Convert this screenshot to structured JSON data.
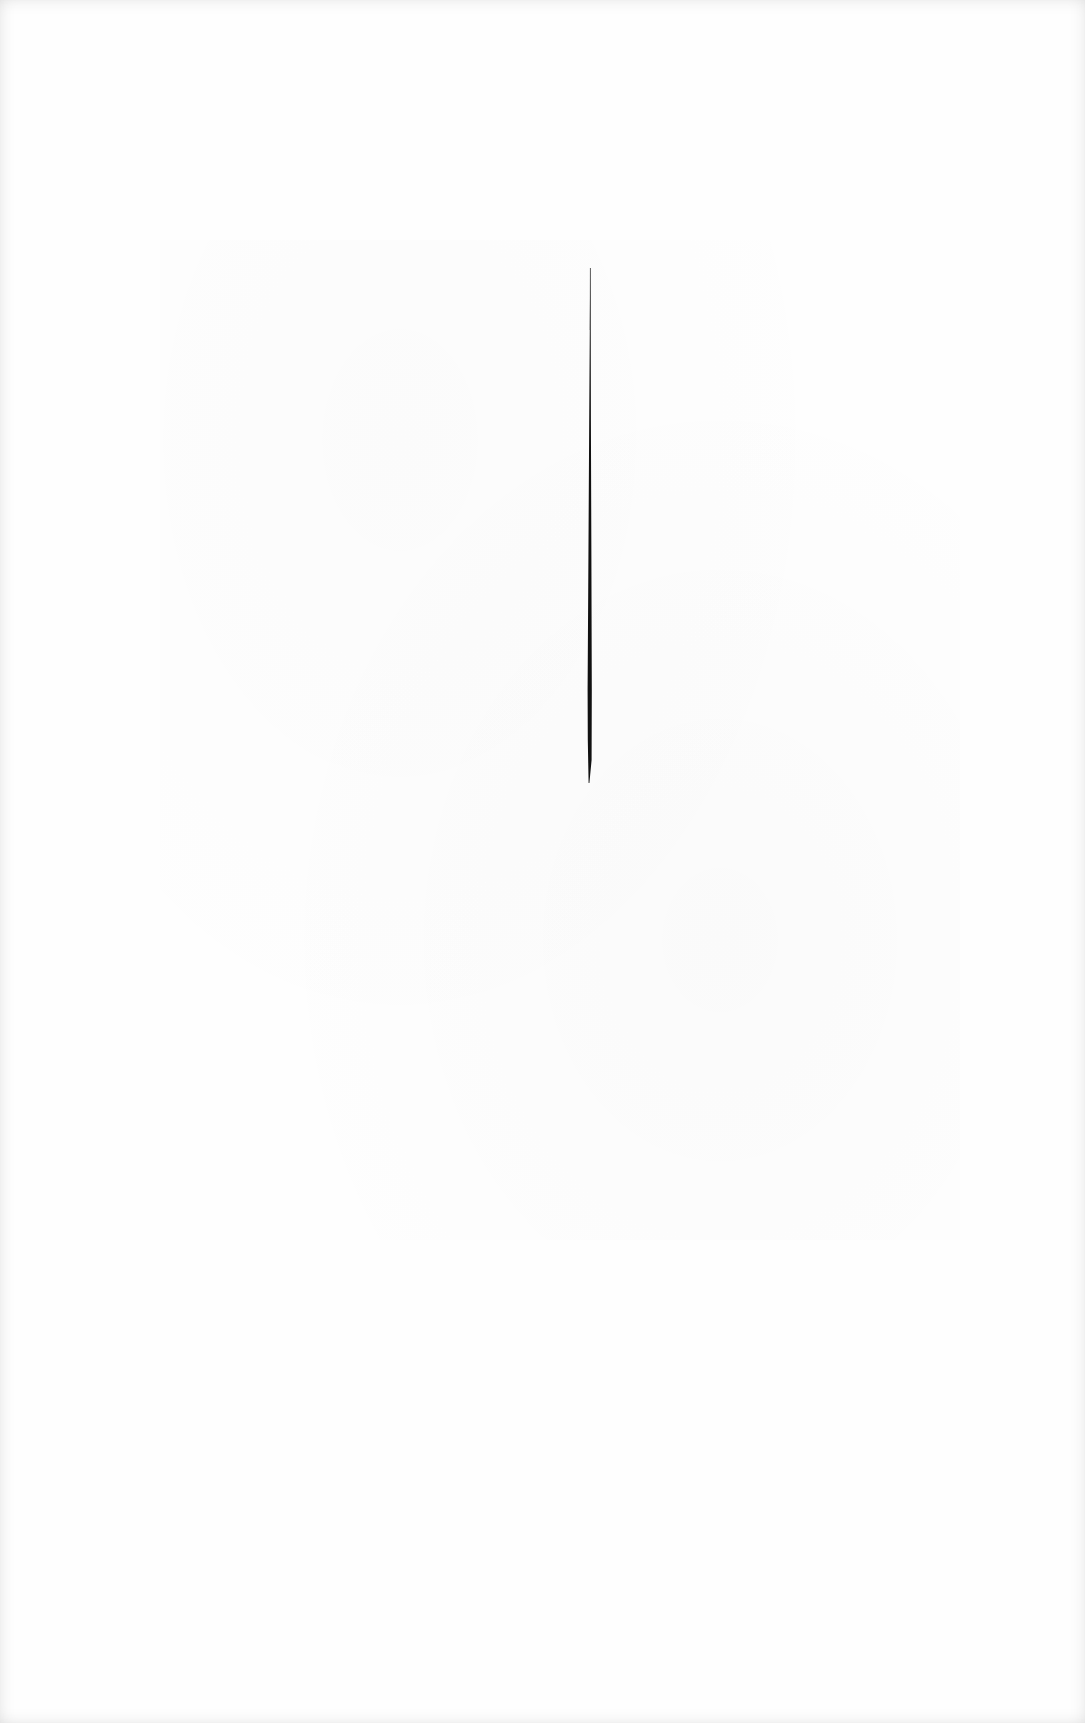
{
  "page": {
    "background": "#fefefe",
    "text_content": []
  },
  "ink_stroke": {
    "color": "#111111",
    "top": {
      "x": 590,
      "y": 268
    },
    "bottom": {
      "x": 588,
      "y": 783
    },
    "width_top": 1,
    "width_max": 4
  }
}
